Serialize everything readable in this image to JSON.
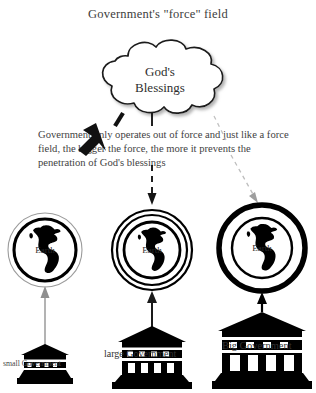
{
  "title": "Government's \"force\" field",
  "cloud": {
    "name": "gods-blessings-cloud",
    "line1": "God's",
    "line2": "Blessings"
  },
  "body_text": "Government only operates out of force and just like a force field, the bigger the force, the more it prevents the penetration of God's blessings",
  "columns": [
    {
      "id": "small",
      "earth_label": "Earth",
      "gov_label": "small Government",
      "field_strength": "thin",
      "blessing_arrow": "solid-bold-black"
    },
    {
      "id": "large",
      "earth_label": "Earth",
      "gov_label": "large Government",
      "field_strength": "medium",
      "blessing_arrow": "dashed-black"
    },
    {
      "id": "big",
      "earth_label": "Earth",
      "gov_label": "Big Government",
      "field_strength": "thick",
      "blessing_arrow": "dashed-faint-gray"
    }
  ],
  "colors": {
    "ink": "#000000",
    "text": "#3d3d3d",
    "faint_arrow": "#b8b8b8",
    "gray_arrow": "#8c8c8c",
    "background": "#ffffff"
  }
}
